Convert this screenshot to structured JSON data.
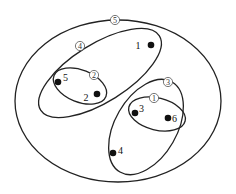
{
  "diagram": {
    "type": "nested-clustering",
    "clusters": [
      {
        "id": "5",
        "label": "⑤",
        "members": [
          "1",
          "2",
          "3",
          "4",
          "5",
          "6"
        ],
        "cx": 118,
        "cy": 101,
        "rx": 103,
        "ry": 81,
        "rot": 0,
        "label_x": 115,
        "label_y": 20
      },
      {
        "id": "4",
        "label": "④",
        "members": [
          "1",
          "2",
          "5"
        ],
        "cx": 100,
        "cy": 73,
        "rx": 70,
        "ry": 29,
        "rot": -32,
        "label_x": 80,
        "label_y": 46
      },
      {
        "id": "2",
        "label": "②",
        "members": [
          "2",
          "5"
        ],
        "cx": 80,
        "cy": 86,
        "rx": 28,
        "ry": 16,
        "rot": 22,
        "label_x": 94,
        "label_y": 75
      },
      {
        "id": "3",
        "label": "③",
        "members": [
          "3",
          "4",
          "6"
        ],
        "cx": 146,
        "cy": 127,
        "rx": 52,
        "ry": 31,
        "rot": -60,
        "label_x": 168,
        "label_y": 82
      },
      {
        "id": "1",
        "label": "①",
        "members": [
          "3",
          "6"
        ],
        "cx": 157,
        "cy": 114,
        "rx": 29,
        "ry": 16,
        "rot": 14,
        "label_x": 154,
        "label_y": 98
      }
    ],
    "points": [
      {
        "id": "1",
        "label": "1",
        "x": 151,
        "y": 45,
        "label_dx": -13,
        "label_dy": 0
      },
      {
        "id": "2",
        "label": "2",
        "x": 97,
        "y": 94,
        "label_dx": -11,
        "label_dy": 3
      },
      {
        "id": "3",
        "label": "3",
        "x": 135,
        "y": 113,
        "label_dx": 4,
        "label_dy": -5
      },
      {
        "id": "4",
        "label": "4",
        "x": 113,
        "y": 153,
        "label_dx": 5,
        "label_dy": -3
      },
      {
        "id": "5",
        "label": "5",
        "x": 58,
        "y": 82,
        "label_dx": 5,
        "label_dy": -5
      },
      {
        "id": "6",
        "label": "6",
        "x": 168,
        "y": 118,
        "label_dx": 4,
        "label_dy": 0
      }
    ]
  }
}
